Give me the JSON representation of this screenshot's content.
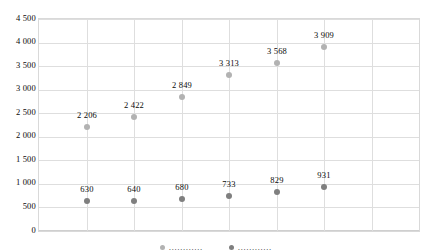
{
  "chart_data": {
    "type": "scatter",
    "title": "",
    "subtitle": "",
    "xlabel": "",
    "ylabel": "",
    "ylim": [
      0,
      4500
    ],
    "ytick_step": 500,
    "ytick_labels": [
      "4 500",
      "4 000",
      "3 500",
      "3 000",
      "2 500",
      "2 000",
      "1 500",
      "1 000",
      "500",
      "0"
    ],
    "ytick_values": [
      4500,
      4000,
      3500,
      3000,
      2500,
      2000,
      1500,
      1000,
      500,
      0
    ],
    "grid": {
      "horizontal": true,
      "vertical": true
    },
    "legend_position": "bottom",
    "x": [
      1,
      2,
      3,
      4,
      5,
      6
    ],
    "xtick_labels": [
      "",
      "",
      "",
      "",
      "",
      ""
    ],
    "series": [
      {
        "name": "upper-series",
        "color": "#b2b2b2",
        "values": [
          2206,
          2422,
          2849,
          3313,
          3568,
          3909
        ],
        "labels": [
          "2 206",
          "2 422",
          "2 849",
          "3 313",
          "3 568",
          "3 909"
        ]
      },
      {
        "name": "lower-series",
        "color": "#7f7f7f",
        "values": [
          630,
          640,
          680,
          733,
          829,
          931
        ],
        "labels": [
          "630",
          "640",
          "680",
          "733",
          "829",
          "931"
        ]
      }
    ]
  },
  "legend": {
    "cropped": true,
    "entries": [
      {
        "label": "…………"
      },
      {
        "label": "…………"
      }
    ]
  }
}
